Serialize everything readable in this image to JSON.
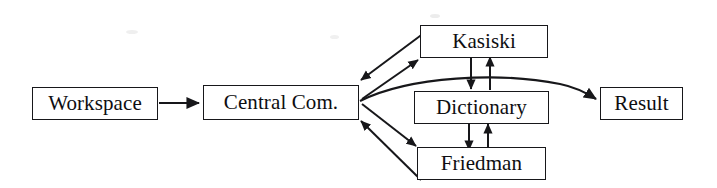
{
  "diagram": {
    "type": "flowchart",
    "background_color": "#ffffff",
    "stroke_color": "#17171a",
    "text_color": "#0e0e11",
    "nodes": [
      {
        "id": "workspace",
        "label": "Workspace",
        "x": 32,
        "y": 87,
        "width": 126,
        "height": 33
      },
      {
        "id": "central",
        "label": "Central Com.",
        "x": 203,
        "y": 85,
        "width": 156,
        "height": 35
      },
      {
        "id": "kasiski",
        "label": "Kasiski",
        "x": 420,
        "y": 25,
        "width": 128,
        "height": 33
      },
      {
        "id": "dictionary",
        "label": "Dictionary",
        "x": 414,
        "y": 91,
        "width": 135,
        "height": 33
      },
      {
        "id": "friedman",
        "label": "Friedman",
        "x": 417,
        "y": 147,
        "width": 129,
        "height": 33
      },
      {
        "id": "result",
        "label": "Result",
        "x": 600,
        "y": 87,
        "width": 83,
        "height": 33
      }
    ],
    "edges": [
      {
        "id": "workspace-to-central",
        "from": "workspace",
        "to": "central",
        "style": "straight",
        "direction": "forward"
      },
      {
        "id": "central-to-kasiski",
        "from": "central",
        "to": "kasiski",
        "style": "straight",
        "direction": "forward"
      },
      {
        "id": "kasiski-to-central",
        "from": "kasiski",
        "to": "central",
        "style": "straight",
        "direction": "forward"
      },
      {
        "id": "central-to-friedman",
        "from": "central",
        "to": "friedman",
        "style": "straight",
        "direction": "forward"
      },
      {
        "id": "friedman-to-central",
        "from": "friedman",
        "to": "central",
        "style": "straight",
        "direction": "forward"
      },
      {
        "id": "central-to-result",
        "from": "central",
        "to": "result",
        "style": "curved",
        "direction": "forward"
      },
      {
        "id": "kasiski-to-dictionary",
        "from": "kasiski",
        "to": "dictionary",
        "style": "straight",
        "direction": "forward"
      },
      {
        "id": "dictionary-to-kasiski",
        "from": "dictionary",
        "to": "kasiski",
        "style": "straight",
        "direction": "forward"
      },
      {
        "id": "dictionary-to-friedman",
        "from": "dictionary",
        "to": "friedman",
        "style": "straight",
        "direction": "forward"
      },
      {
        "id": "friedman-to-dictionary",
        "from": "friedman",
        "to": "dictionary",
        "style": "straight",
        "direction": "forward"
      }
    ]
  }
}
